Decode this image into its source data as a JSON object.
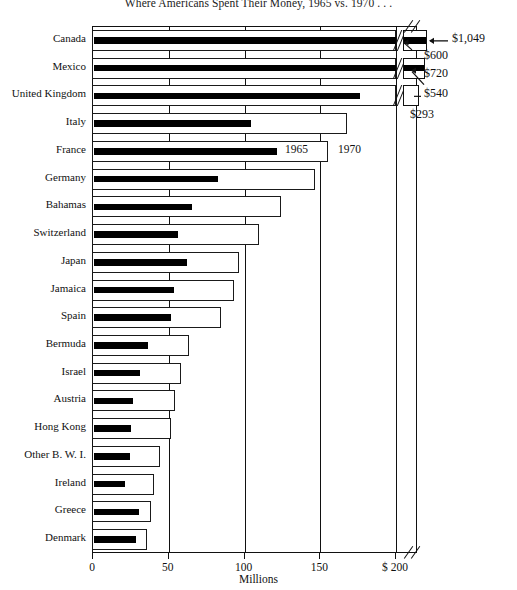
{
  "title": "Where Americans Spent Their Money, 1965 vs. 1970 . . .",
  "axis": {
    "xlabel": "Millions",
    "ticks": [
      {
        "label": "0",
        "value": 0
      },
      {
        "label": "50",
        "value": 50
      },
      {
        "label": "100",
        "value": 100
      },
      {
        "label": "150",
        "value": 150
      },
      {
        "label": "$ 200",
        "value": 200
      }
    ]
  },
  "legend": [
    {
      "label": "1965",
      "swatch": "solid-black"
    },
    {
      "label": "1970",
      "swatch": "white-outline"
    }
  ],
  "callouts": [
    {
      "label": "$1,049",
      "target": "Canada 1970"
    },
    {
      "label": "$600",
      "target": "Mexico 1965"
    },
    {
      "label": "$720",
      "target": "Mexico 1970"
    },
    {
      "label": "$540",
      "target": "United Kingdom 1970"
    },
    {
      "label": "$293",
      "target": "United Kingdom 1965"
    }
  ],
  "chart_data": {
    "type": "bar",
    "orientation": "horizontal",
    "title": "Where Americans Spent Their Money, 1965 vs. 1970 . . .",
    "xlabel": "Millions",
    "ylabel": "",
    "xlim": [
      0,
      200
    ],
    "axis_break": true,
    "axis_break_note": "Axis broken beyond $200 million; Canada, Mexico and United Kingdom bars exceed the scale",
    "grid": "vertical gridlines at 50, 100, 150, 200",
    "legend_position": "inline on France / Germany rows",
    "categories": [
      "Canada",
      "Mexico",
      "United Kingdom",
      "Italy",
      "France",
      "Germany",
      "Bahamas",
      "Switzerland",
      "Japan",
      "Jamaica",
      "Spain",
      "Bermuda",
      "Israel",
      "Austria",
      "Hong Kong",
      "Other B. W. I.",
      "Ireland",
      "Greece",
      "Denmark"
    ],
    "series": [
      {
        "name": "1965",
        "swatch": "solid-black",
        "values": [
          600,
          420,
          293,
          105,
          122,
          83,
          66,
          57,
          63,
          54,
          52,
          37,
          32,
          27,
          26,
          25,
          22,
          31,
          29
        ]
      },
      {
        "name": "1970",
        "swatch": "white-outline",
        "values": [
          1049,
          720,
          540,
          168,
          156,
          147,
          125,
          110,
          97,
          94,
          85,
          64,
          59,
          55,
          52,
          45,
          41,
          39,
          36
        ]
      }
    ],
    "over_scale": [
      {
        "category": "Canada",
        "series": "1970",
        "value": 1049,
        "label": "$1,049"
      },
      {
        "category": "Canada",
        "series": "1965",
        "value": 600
      },
      {
        "category": "Mexico",
        "series": "1970",
        "value": 720,
        "label": "$720"
      },
      {
        "category": "Mexico",
        "series": "1965",
        "value": 600,
        "label": "$600"
      },
      {
        "category": "United Kingdom",
        "series": "1970",
        "value": 540,
        "label": "$540"
      },
      {
        "category": "United Kingdom",
        "series": "1965",
        "value": 293,
        "label": "$293"
      }
    ]
  }
}
